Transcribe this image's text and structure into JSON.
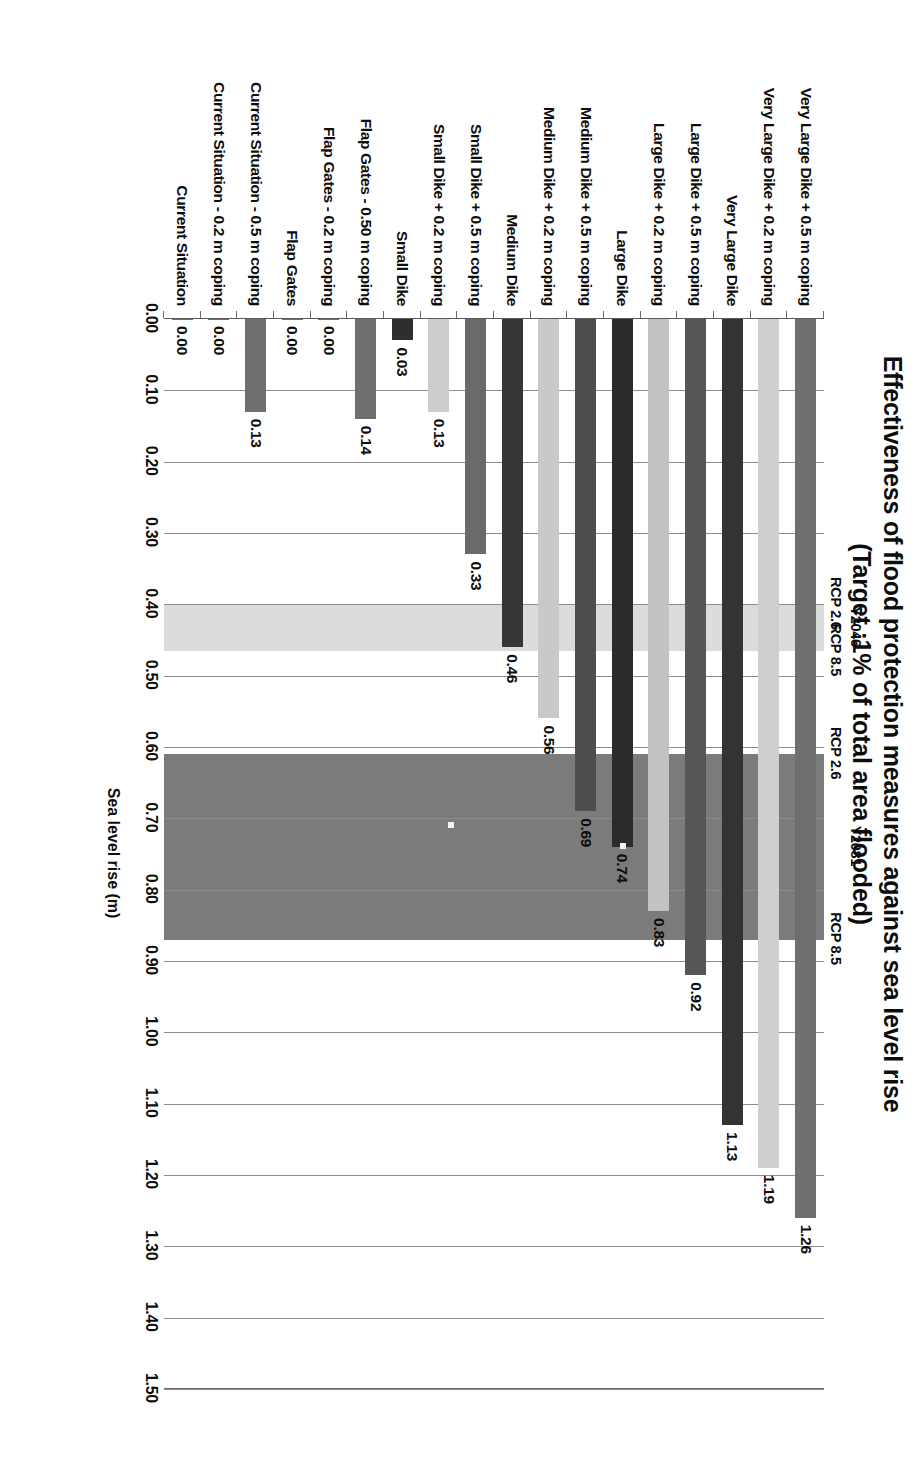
{
  "chart_data": {
    "type": "bar",
    "orientation": "vertical-printed-sideways",
    "title": "Effectiveness of flood protection measures against sea level rise",
    "subtitle": "(Target :1% of total area flooded)",
    "xlabel": "",
    "ylabel": "Sea level rise (m)",
    "ylim": [
      0.0,
      1.5
    ],
    "tick_labels": [
      "0.00",
      "0.10",
      "0.20",
      "0.30",
      "0.40",
      "0.50",
      "0.60",
      "0.70",
      "0.80",
      "0.90",
      "1.00",
      "1.10",
      "1.20",
      "1.30",
      "1.40",
      "1.50"
    ],
    "tick_values": [
      0.0,
      0.1,
      0.2,
      0.3,
      0.4,
      0.5,
      0.6,
      0.7,
      0.8,
      0.9,
      1.0,
      1.1,
      1.2,
      1.3,
      1.4,
      1.5
    ],
    "grid": true,
    "legend": "none",
    "categories": [
      "Very Large Dike + 0.5 m coping",
      "Very Large Dike + 0.2 m coping",
      "Very Large Dike",
      "Large Dike + 0.5 m coping",
      "Large Dike + 0.2 m coping",
      "Large Dike",
      "Medium Dike + 0.5 m coping",
      "Medium Dike + 0.2 m coping",
      "Medium Dike",
      "Small Dike + 0.5 m coping",
      "Small Dike + 0.2 m coping",
      "Small Dike",
      "Flap Gates - 0.50 m coping",
      "Flap Gates - 0.2 m coping",
      "Flap Gates",
      "Current Situation - 0.5 m coping",
      "Current Situation - 0.2 m coping",
      "Current Situation"
    ],
    "values": [
      1.26,
      1.19,
      1.13,
      0.92,
      0.83,
      0.74,
      0.69,
      0.56,
      0.46,
      0.33,
      0.13,
      0.03,
      0.14,
      0.0,
      0.0,
      0.13,
      0.0,
      0.0
    ],
    "value_labels": [
      "1.26",
      "1.19",
      "1.13",
      "0.92",
      "0.83",
      "0.74",
      "0.69",
      "0.56",
      "0.46",
      "0.33",
      "0.13",
      "0.03",
      "0.14",
      "0.00",
      "0.00",
      "0.13",
      "0.00",
      "0.00"
    ],
    "bar_colors": [
      "#6e6e6e",
      "#cfcfcf",
      "#333333",
      "#565656",
      "#c2c2c2",
      "#2b2b2b",
      "#4d4d4d",
      "#c9c9c9",
      "#363636",
      "#6a6a6a",
      "#cccccc",
      "#2e2e2e",
      "#6e6e6e",
      "#6e6e6e",
      "#6e6e6e",
      "#6e6e6e",
      "#6e6e6e",
      "#6e6e6e"
    ],
    "bands": [
      {
        "name": "Y2081",
        "label": "Y2081",
        "lower_label": "RCP 2.6",
        "upper_label": "RCP 8.5",
        "lower": 0.61,
        "upper": 0.87,
        "color": "#7b7b7b"
      },
      {
        "name": "Y2046",
        "label": "Y2046",
        "lower_label": "RCP 2.6",
        "upper_label": "RCP 8.5",
        "lower": 0.4,
        "upper": 0.465,
        "color": "#dcdcdc"
      }
    ]
  }
}
